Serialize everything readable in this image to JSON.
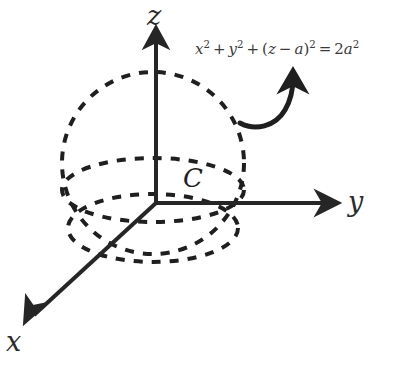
{
  "figure": {
    "type": "3d-coordinate-sphere-diagram",
    "background_color": "#ffffff",
    "stroke_color": "#262626",
    "dash_color": "#1f1f1f"
  },
  "axes": {
    "z": {
      "label": "z",
      "direction": "up"
    },
    "y": {
      "label": "y",
      "direction": "right"
    },
    "x": {
      "label": "x",
      "direction": "down-left"
    }
  },
  "curve": {
    "label": "C"
  },
  "equation": {
    "full_text": "x² + y² + (z − a)² = 2a²",
    "terms": {
      "x_var": "x",
      "x_exp": "2",
      "plus_1": "+",
      "y_var": "y",
      "y_exp": "2",
      "plus_2": "+",
      "open_paren": "(",
      "z_var": "z",
      "minus": "−",
      "a_var": "a",
      "close_paren": ")",
      "paren_exp": "2",
      "equals": "=",
      "rhs_coeff": "2",
      "rhs_var": "a",
      "rhs_exp": "2"
    }
  }
}
